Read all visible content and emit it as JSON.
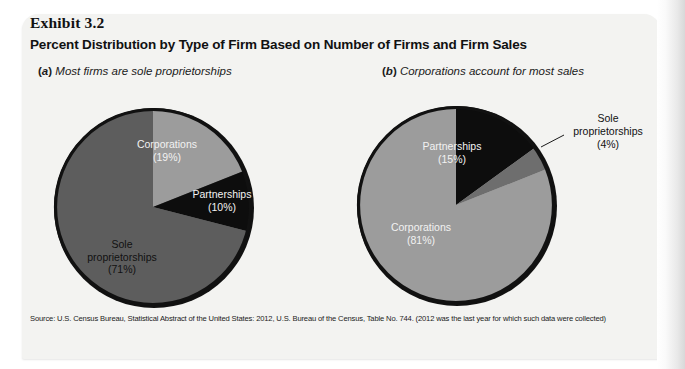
{
  "exhibit": {
    "number": "Exhibit 3.2",
    "title": "Percent Distribution by Type of Firm Based on Number of Firms and Firm Sales",
    "source_note": "Source: U.S. Census Bureau, Statistical Abstract of the United States: 2012, U.S. Bureau of the Census, Table No. 744. (2012 was the last year for which such data were collected)"
  },
  "panels": {
    "a": {
      "letter": "(a)",
      "caption": "Most firms are sole proprietorships",
      "labels": {
        "corporations": {
          "name": "Corporations",
          "pct": "(19%)"
        },
        "partnerships": {
          "name": "Partnerships",
          "pct": "(10%)"
        },
        "sole_line1": "Sole",
        "sole_line2": "proprietorships",
        "sole_pct": "(71%)"
      }
    },
    "b": {
      "letter": "(b)",
      "caption": "Corporations account for most sales",
      "labels": {
        "partnerships": {
          "name": "Partnerships",
          "pct": "(15%)"
        },
        "corporations": {
          "name": "Corporations",
          "pct": "(81%)"
        },
        "sole_line1": "Sole",
        "sole_line2": "proprietorships",
        "sole_pct": "(4%)"
      }
    }
  },
  "colors": {
    "light_gray": "#9c9c9c",
    "mid_gray": "#6e6e6e",
    "dark_gray": "#5d5d5d",
    "black": "#0d0d0d",
    "card_background": "#f3f3f1",
    "rim": "#111111"
  },
  "chart_data": [
    {
      "type": "pie",
      "title": "Most firms are sole proprietorships",
      "panel": "(a)",
      "unit": "percent of number of firms",
      "categories": [
        "Corporations",
        "Partnerships",
        "Sole proprietorships"
      ],
      "values": [
        19,
        10,
        71
      ],
      "labels": [
        "(19%)",
        "(10%)",
        "(71%)"
      ],
      "colors": [
        "#9c9c9c",
        "#0d0d0d",
        "#5d5d5d"
      ],
      "start_angle_deg": 0,
      "direction": "clockwise",
      "legend": "none",
      "grid": false
    },
    {
      "type": "pie",
      "title": "Corporations account for most sales",
      "panel": "(b)",
      "unit": "percent of firm sales",
      "categories": [
        "Partnerships",
        "Sole proprietorships",
        "Corporations"
      ],
      "values": [
        15,
        4,
        81
      ],
      "labels": [
        "(15%)",
        "(4%)",
        "(81%)"
      ],
      "colors": [
        "#0d0d0d",
        "#6e6e6e",
        "#9c9c9c"
      ],
      "start_angle_deg": 0,
      "direction": "clockwise",
      "legend": "none",
      "grid": false,
      "annotations": [
        {
          "text": "Sole proprietorships (4%)",
          "target": "Sole proprietorships",
          "leader_line": true
        }
      ]
    }
  ]
}
